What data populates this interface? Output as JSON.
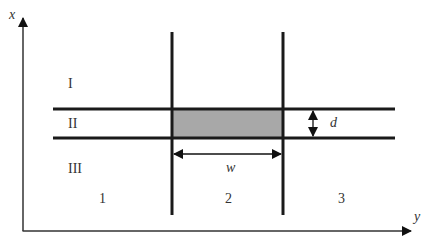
{
  "diagram": {
    "axes": {
      "vertical_label": "x",
      "horizontal_label": "y"
    },
    "regions_rows": [
      "I",
      "II",
      "III"
    ],
    "regions_columns": [
      "1",
      "2",
      "3"
    ],
    "dimensions": {
      "width_label": "w",
      "thickness_label": "d"
    },
    "colors": {
      "line": "#1a1a1a",
      "axis": "#333333",
      "shaded_region": "#a8a8a8",
      "background": "#ffffff"
    }
  }
}
